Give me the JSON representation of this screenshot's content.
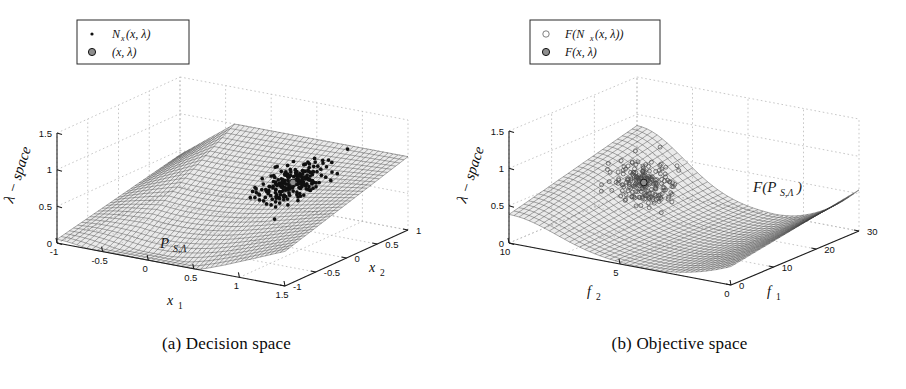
{
  "figure": {
    "panels": [
      {
        "id": "a",
        "caption": "(a) Decision space",
        "legend": [
          {
            "marker": "small-dot",
            "label": "N",
            "label_sub": "x",
            "label_rest": "(x, λ)"
          },
          {
            "marker": "filled-circle",
            "label": "",
            "label_sub": "",
            "label_rest": "(x, λ)"
          }
        ],
        "surface_annotation": {
          "base": "P",
          "sub": "S,Λ"
        },
        "axes": {
          "z": {
            "title": "λ − space",
            "ticks": [
              "0",
              "0.5",
              "1",
              "1.5"
            ],
            "values": [
              0,
              0.5,
              1,
              1.5
            ]
          },
          "x": {
            "title": "x",
            "title_sub": "1",
            "ticks": [
              "-1",
              "-0.5",
              "0",
              "0.5",
              "1",
              "1.5"
            ],
            "values": [
              -1,
              -0.5,
              0,
              0.5,
              1,
              1.5
            ]
          },
          "y": {
            "title": "x",
            "title_sub": "2",
            "ticks": [
              "1",
              "0.5",
              "0",
              "-0.5",
              "-1"
            ],
            "values": [
              1,
              0.5,
              0,
              -0.5,
              -1
            ]
          }
        }
      },
      {
        "id": "b",
        "caption": "(b) Objective space",
        "legend": [
          {
            "marker": "open-circle",
            "label": "F(N",
            "label_sub": "x",
            "label_rest": "(x, λ))"
          },
          {
            "marker": "filled-circle",
            "label": "F",
            "label_sub": "",
            "label_rest": "(x, λ)"
          }
        ],
        "surface_annotation": {
          "base": "F(P",
          "sub": "S,Λ",
          "close": ")"
        },
        "axes": {
          "z": {
            "title": "λ − space",
            "ticks": [
              "0",
              "0.5",
              "1",
              "1.5"
            ],
            "values": [
              0,
              0.5,
              1,
              1.5
            ]
          },
          "x": {
            "title": "f",
            "title_sub": "1",
            "ticks": [
              "0",
              "10",
              "20",
              "30"
            ],
            "values": [
              0,
              10,
              20,
              30
            ]
          },
          "y": {
            "title": "f",
            "title_sub": "2",
            "ticks": [
              "10",
              "5",
              "0"
            ],
            "values": [
              10,
              5,
              0
            ]
          }
        }
      }
    ]
  },
  "chart_data": [
    {
      "type": "surface-3d-scatter",
      "panel": "a",
      "title": "(a) Decision space",
      "xlabel": "x_1",
      "ylabel": "x_2",
      "zlabel": "lambda - space",
      "xlim": [
        -1,
        1.5
      ],
      "ylim": [
        -1,
        1
      ],
      "zlim": [
        0,
        1.5
      ],
      "xticks": [
        -1,
        -0.5,
        0,
        0.5,
        1,
        1.5
      ],
      "yticks": [
        -1,
        -0.5,
        0,
        0.5,
        1
      ],
      "zticks": [
        0,
        0.5,
        1,
        1.5
      ],
      "grid": true,
      "legend_position": "upper-left",
      "surface_label": "P_{S,Lambda}",
      "surface_description": "Curved mesh sheet spanning the x1-x2 domain, rising from z=0 at the front-left corner to z=1 along the back edge, with a saddle-like dip across the middle.",
      "series": [
        {
          "name": "N_x(x, lambda)",
          "marker": "small-dot",
          "color": "#101010",
          "point_count": 220,
          "cluster_center_xyz": [
            0.75,
            0.35,
            1.28
          ],
          "cluster_spread_xyz": [
            0.22,
            0.2,
            0.12
          ]
        },
        {
          "name": "(x, lambda)",
          "marker": "filled-circle",
          "color": "#8e8e8e",
          "point_count": 1,
          "cluster_center_xyz": [
            0.75,
            0.35,
            1.28
          ]
        }
      ]
    },
    {
      "type": "surface-3d-scatter",
      "panel": "b",
      "title": "(b) Objective space",
      "xlabel": "f_1",
      "ylabel": "f_2",
      "zlabel": "lambda - space",
      "xlim": [
        0,
        30
      ],
      "ylim": [
        0,
        10
      ],
      "zlim": [
        0,
        1.5
      ],
      "xticks": [
        0,
        10,
        20,
        30
      ],
      "yticks": [
        0,
        5,
        10
      ],
      "zticks": [
        0,
        0.5,
        1,
        1.5
      ],
      "grid": true,
      "legend_position": "upper-left",
      "surface_label": "F(P_{S,Lambda})",
      "surface_description": "Mapped mesh surface forming a curved trough: high at the f2=10 / f1=0 corner near z=0.85, sweeping down to the f1 axis and curling up again toward large f1.",
      "series": [
        {
          "name": "F(N_x(x, lambda))",
          "marker": "open-circle",
          "color": "#4a4a4a",
          "point_count": 200,
          "cluster_center_xyz": [
            6.0,
            7.4,
            0.52
          ],
          "cluster_spread_xyz": [
            1.6,
            1.2,
            0.1
          ]
        },
        {
          "name": "F(x, lambda)",
          "marker": "filled-circle",
          "color": "#8e8e8e",
          "point_count": 1,
          "cluster_center_xyz": [
            6.0,
            7.4,
            0.52
          ]
        }
      ]
    }
  ]
}
